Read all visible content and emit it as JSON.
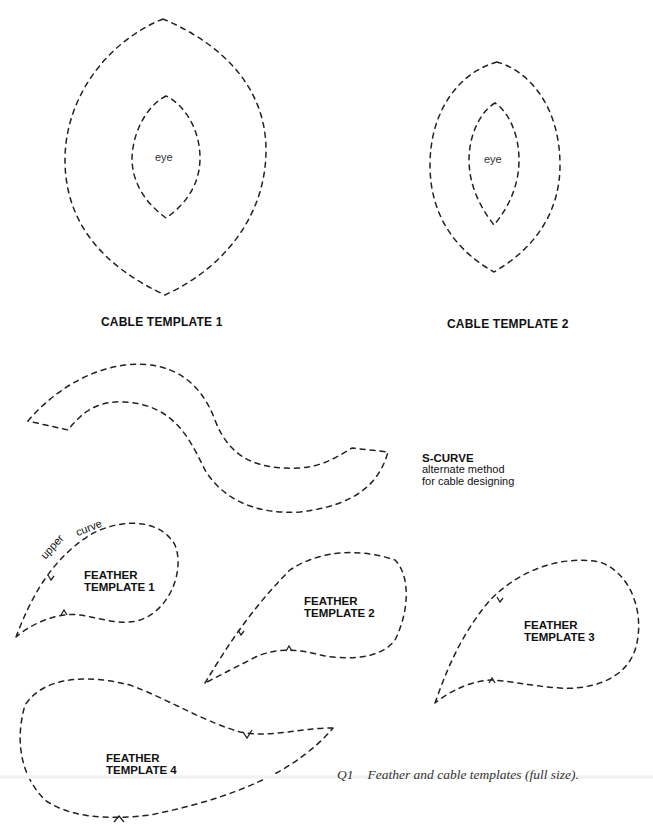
{
  "cable_templates": [
    {
      "title": "CABLE TEMPLATE 1",
      "inner_label": "eye"
    },
    {
      "title": "CABLE TEMPLATE 2",
      "inner_label": "eye"
    }
  ],
  "s_curve": {
    "title": "S-CURVE",
    "description_line1": "alternate method",
    "description_line2": "for cable designing"
  },
  "feather_templates": [
    {
      "line1": "FEATHER",
      "line2": "TEMPLATE 1",
      "annotation_word1": "upper",
      "annotation_word2": "curve"
    },
    {
      "line1": "FEATHER",
      "line2": "TEMPLATE 2"
    },
    {
      "line1": "FEATHER",
      "line2": "TEMPLATE 3"
    },
    {
      "line1": "FEATHER",
      "line2": "TEMPLATE 4"
    }
  ],
  "caption": {
    "figure_number": "Q1",
    "text": "Feather and cable templates (full size)."
  },
  "colors": {
    "stroke": "#222222",
    "background": "#ffffff",
    "caption": "#333333"
  }
}
